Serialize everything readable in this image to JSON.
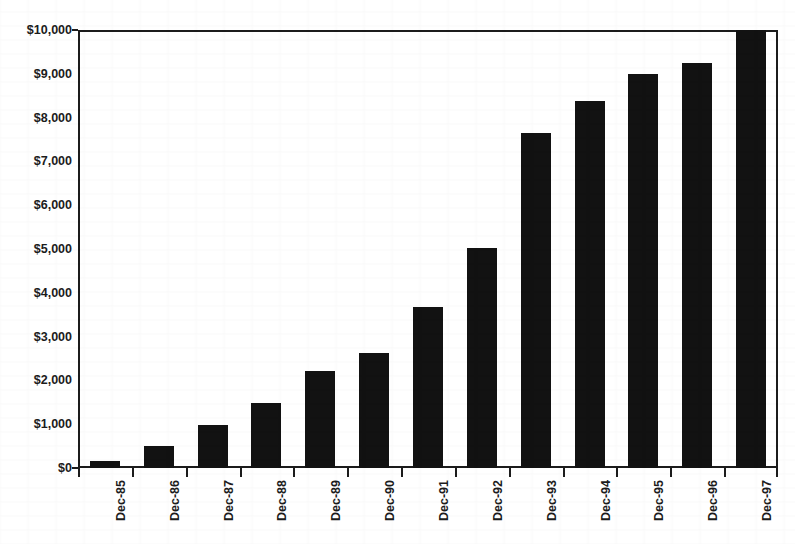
{
  "chart_data": {
    "type": "bar",
    "title": "",
    "title_note": "title cropped off top edge of image; only descender pixels and parentheses visible",
    "xlabel": "",
    "ylabel": "",
    "categories": [
      "Dec-85",
      "Dec-86",
      "Dec-87",
      "Dec-88",
      "Dec-89",
      "Dec-90",
      "Dec-91",
      "Dec-92",
      "Dec-93",
      "Dec-94",
      "Dec-95",
      "Dec-96",
      "Dec-97"
    ],
    "values": [
      160,
      500,
      980,
      1480,
      2210,
      2630,
      3670,
      5020,
      7640,
      8390,
      8990,
      9250,
      10000
    ],
    "ylim": [
      0,
      10000
    ],
    "ytick_values": [
      0,
      1000,
      2000,
      3000,
      4000,
      5000,
      6000,
      7000,
      8000,
      9000,
      10000
    ],
    "ytick_labels": [
      "$0",
      "$1,000",
      "$2,000",
      "$3,000",
      "$4,000",
      "$5,000",
      "$6,000",
      "$7,000",
      "$8,000",
      "$9,000",
      "$10,000"
    ],
    "grid": false,
    "legend": null,
    "bar_color": "#121212",
    "axis_color": "#1c1c1c",
    "background": "#ffffff"
  },
  "axes": {
    "y_axis_name": "y-axis",
    "x_axis_name": "x-axis"
  }
}
